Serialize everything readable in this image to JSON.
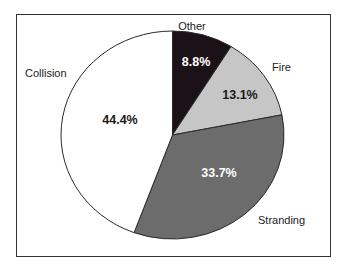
{
  "chart_data": {
    "type": "pie",
    "title": "",
    "slices": [
      {
        "label": "Other",
        "value": 8.8,
        "display": "8.8%",
        "color": "#1a1216",
        "text_color": "#ffffff"
      },
      {
        "label": "Fire",
        "value": 13.1,
        "display": "13.1%",
        "color": "#c6c6c6",
        "text_color": "#1a1a1a"
      },
      {
        "label": "Stranding",
        "value": 33.7,
        "display": "33.7%",
        "color": "#6c6c6c",
        "text_color": "#ffffff"
      },
      {
        "label": "Collision",
        "value": 44.4,
        "display": "44.4%",
        "color": "#ffffff",
        "text_color": "#1a1a1a"
      }
    ],
    "start_angle": "12 o'clock, clockwise",
    "legend": "none (direct labels)"
  },
  "labels": {
    "other": "Other",
    "fire": "Fire",
    "stranding": "Stranding",
    "collision": "Collision"
  },
  "values": {
    "other": "8.8%",
    "fire": "13.1%",
    "stranding": "33.7%",
    "collision": "44.4%"
  }
}
